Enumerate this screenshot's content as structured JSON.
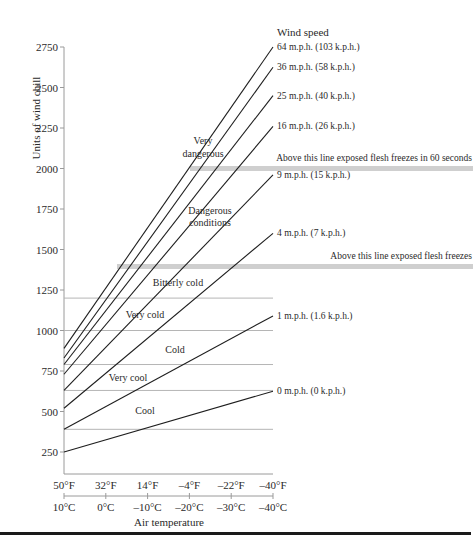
{
  "chart_data": {
    "type": "line",
    "title": "",
    "xlabel": "Air temperature",
    "ylabel": "Units of wind chill",
    "legend_title": "Wind speed",
    "ylim": [
      250,
      2750
    ],
    "y_ticks": [
      250,
      500,
      750,
      1000,
      1250,
      1500,
      1750,
      2000,
      2250,
      2500,
      2750
    ],
    "y_tick_labels": [
      "250",
      "500",
      "750",
      "1000",
      "1250",
      "1500",
      "1750",
      "2000",
      "2250",
      "2500",
      "2750"
    ],
    "x_ticks_f": [
      "50°F",
      "32°F",
      "14°F",
      "–4°F",
      "–22°F",
      "–40°F"
    ],
    "x_ticks_c": [
      "10°C",
      "0°C",
      "–10°C",
      "–20°C",
      "–30°C",
      "–40°C"
    ],
    "x_values_f": [
      50,
      -40
    ],
    "series": [
      {
        "name": "64 m.p.h. (103 k.p.h.)",
        "values": [
          890,
          2750
        ]
      },
      {
        "name": "36 m.p.h. (58 k.p.h.)",
        "values": [
          830,
          2625
        ]
      },
      {
        "name": "25 m.p.h. (40 k.p.h.)",
        "values": [
          790,
          2450
        ]
      },
      {
        "name": "16 m.p.h. (26 k.p.h.)",
        "values": [
          730,
          2260
        ]
      },
      {
        "name": "9 m.p.h. (15 k.p.h.)",
        "values": [
          630,
          1960
        ]
      },
      {
        "name": "4 m.p.h. (7 k.p.h.)",
        "values": [
          520,
          1600
        ]
      },
      {
        "name": "1 m.p.h. (1.6 k.p.h.)",
        "values": [
          390,
          1090
        ]
      },
      {
        "name": "0 m.p.h. (0 k.p.h.)",
        "values": [
          250,
          625
        ]
      }
    ],
    "zone_thresholds": [
      390,
      630,
      790,
      1000,
      1200
    ],
    "zones": [
      {
        "label": "Cool"
      },
      {
        "label": "Very cool"
      },
      {
        "label": "Cold"
      },
      {
        "label": "Very cold"
      },
      {
        "label": "Bitterly cold"
      },
      {
        "label": "Dangerous conditions"
      },
      {
        "label": "Very dangerous"
      }
    ],
    "bands": [
      {
        "value": 2000,
        "label": "Above this line exposed flesh freezes in 60 seconds"
      },
      {
        "value": 1400,
        "label": "Above this line exposed flesh freezes"
      }
    ],
    "grid": false,
    "legend_position": "right (line-end labels)"
  },
  "labels": {
    "ylabel": "Units of wind chill",
    "xlabel": "Air temperature",
    "legend_title": "Wind speed",
    "zone_cool": "Cool",
    "zone_very_cool": "Very cool",
    "zone_cold": "Cold",
    "zone_very_cold": "Very cold",
    "zone_bitterly_cold": "Bitterly cold",
    "zone_dangerous_1": "Dangerous",
    "zone_dangerous_2": "conditions",
    "zone_very_dangerous_1": "Very",
    "zone_very_dangerous_2": "dangerous",
    "band_60s": "Above this line exposed flesh freezes in 60 seconds",
    "band_freezes": "Above this line exposed flesh freezes"
  }
}
